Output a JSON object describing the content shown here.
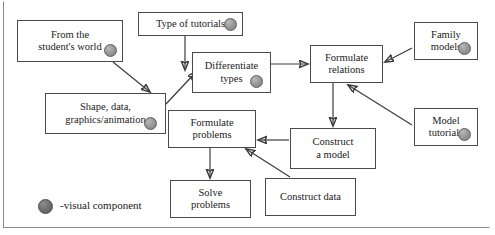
{
  "diagram": {
    "legend": {
      "marker_label": "-visual component",
      "marker_icon": "filled-circle-icon"
    },
    "colors": {
      "box_border": "#4a4a4a",
      "arrow": "#3c3c3c",
      "visual_component_dot": "#8e8e8e",
      "legend_dot": "#6e6e6e",
      "background": "#ffffff",
      "frame_border": "#8a8a8a"
    },
    "nodes": [
      {
        "id": "from_student_world",
        "label": "From the\nstudent's world",
        "x": 17,
        "y": 20,
        "w": 106,
        "h": 42,
        "font": 10.5,
        "has_dot": true,
        "dot_x": 104,
        "dot_y": 44,
        "dot_d": 13
      },
      {
        "id": "shape_data",
        "label": "Shape, data,\ngraphics/animation",
        "x": 45,
        "y": 93,
        "w": 121,
        "h": 41,
        "font": 10.5,
        "has_dot": true,
        "dot_x": 144,
        "dot_y": 117,
        "dot_d": 13
      },
      {
        "id": "type_of_tutorials",
        "label": "Type of tutorials",
        "x": 138,
        "y": 12,
        "w": 105,
        "h": 24,
        "font": 10.5,
        "has_dot": true,
        "dot_x": 224,
        "dot_y": 18,
        "dot_d": 13
      },
      {
        "id": "differentiate_types",
        "label": "Differentiate\ntypes",
        "x": 192,
        "y": 52,
        "w": 79,
        "h": 41,
        "font": 10.5,
        "has_dot": true,
        "dot_x": 250,
        "dot_y": 75,
        "dot_d": 13
      },
      {
        "id": "formulate_relations",
        "label": "Formulate\nrelations",
        "x": 310,
        "y": 45,
        "w": 73,
        "h": 38,
        "font": 10.5,
        "has_dot": false,
        "dot_x": 0,
        "dot_y": 0,
        "dot_d": 0
      },
      {
        "id": "family_models",
        "label": "Family\nmodels",
        "x": 414,
        "y": 22,
        "w": 64,
        "h": 38,
        "font": 10.5,
        "has_dot": true,
        "dot_x": 458,
        "dot_y": 42,
        "dot_d": 13
      },
      {
        "id": "model_tutorials",
        "label": "Model\ntutorials",
        "x": 414,
        "y": 108,
        "w": 64,
        "h": 38,
        "font": 10.5,
        "has_dot": true,
        "dot_x": 458,
        "dot_y": 128,
        "dot_d": 13
      },
      {
        "id": "formulate_problems",
        "label": "Formulate\nproblems",
        "x": 168,
        "y": 110,
        "w": 88,
        "h": 38,
        "font": 10.5,
        "has_dot": false,
        "dot_x": 0,
        "dot_y": 0,
        "dot_d": 0
      },
      {
        "id": "construct_a_model",
        "label": "Construct\na model",
        "x": 290,
        "y": 128,
        "w": 86,
        "h": 41,
        "font": 10.5,
        "has_dot": false,
        "dot_x": 0,
        "dot_y": 0,
        "dot_d": 0
      },
      {
        "id": "solve_problems",
        "label": "Solve\nproblems",
        "x": 170,
        "y": 180,
        "w": 81,
        "h": 38,
        "font": 10.5,
        "has_dot": false,
        "dot_x": 0,
        "dot_y": 0,
        "dot_d": 0
      },
      {
        "id": "construct_data",
        "label": "Construct data",
        "x": 265,
        "y": 178,
        "w": 91,
        "h": 38,
        "font": 10.5,
        "has_dot": false,
        "dot_x": 0,
        "dot_y": 0,
        "dot_d": 0
      }
    ],
    "edges": [
      {
        "from": "from_student_world",
        "to": "shape_data",
        "x1": 113,
        "y1": 62,
        "x2": 150,
        "y2": 92
      },
      {
        "from": "type_of_tutorials",
        "to": "differentiate_types",
        "x1": 185,
        "y1": 36,
        "x2": 185,
        "y2": 70
      },
      {
        "from": "shape_data",
        "to": "differentiate_types",
        "x1": 166,
        "y1": 104,
        "x2": 196,
        "y2": 72
      },
      {
        "from": "differentiate_types",
        "to": "formulate_relations",
        "x1": 271,
        "y1": 64,
        "x2": 308,
        "y2": 64
      },
      {
        "from": "family_models",
        "to": "formulate_relations",
        "x1": 412,
        "y1": 48,
        "x2": 385,
        "y2": 62
      },
      {
        "from": "model_tutorials",
        "to": "formulate_relations",
        "x1": 412,
        "y1": 125,
        "x2": 348,
        "y2": 85
      },
      {
        "from": "formulate_relations",
        "to": "construct_a_model",
        "x1": 333,
        "y1": 83,
        "x2": 333,
        "y2": 126
      },
      {
        "from": "construct_a_model",
        "to": "formulate_problems",
        "x1": 289,
        "y1": 140,
        "x2": 258,
        "y2": 140
      },
      {
        "from": "construct_data",
        "to": "formulate_problems",
        "x1": 290,
        "y1": 177,
        "x2": 246,
        "y2": 149
      },
      {
        "from": "formulate_problems",
        "to": "solve_problems",
        "x1": 210,
        "y1": 148,
        "x2": 210,
        "y2": 178
      }
    ]
  }
}
